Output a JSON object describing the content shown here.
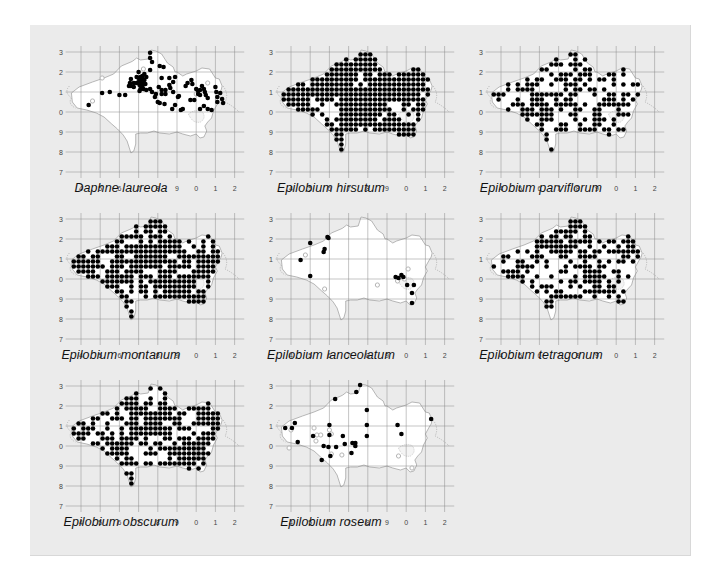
{
  "figure": {
    "background": "#ebebeb",
    "land_fill": "#ffffff",
    "record_color": "#000000",
    "old_record_color": "#b5b5b5",
    "grid_color": "#8a8a8a"
  },
  "axes": {
    "x_labels": [
      "4",
      "5",
      "6",
      "7",
      "8",
      "9",
      "0",
      "1",
      "2"
    ],
    "y_labels": [
      "3",
      "2",
      "1",
      "0",
      "9",
      "8",
      "7"
    ]
  },
  "chart_data": {
    "type": "scatter",
    "xlabel": "",
    "ylabel": "",
    "x_ticks": [
      "4",
      "5",
      "6",
      "7",
      "8",
      "9",
      "0",
      "1",
      "2"
    ],
    "y_ticks": [
      "3",
      "2",
      "1",
      "0",
      "9",
      "8",
      "7"
    ],
    "grid": true,
    "maps": [
      {
        "title": "Daphne laureola",
        "density": "sparse-moderate",
        "approx_records": 110
      },
      {
        "title": "Epilobium hirsutum",
        "density": "very dense",
        "approx_records": 650
      },
      {
        "title": "Epilobium parviflorum",
        "density": "moderate-dense",
        "approx_records": 380
      },
      {
        "title": "Epilobium montanum",
        "density": "dense",
        "approx_records": 560
      },
      {
        "title": "Epilobium lanceolatum",
        "density": "very sparse",
        "approx_records": 16
      },
      {
        "title": "Epilobium tetragonum",
        "density": "moderate-dense",
        "approx_records": 400
      },
      {
        "title": "Epilobium obscurum",
        "density": "dense",
        "approx_records": 520
      },
      {
        "title": "Epilobium roseum",
        "density": "sparse",
        "approx_records": 40
      }
    ]
  },
  "maps": [
    {
      "title": "Daphne laureola",
      "left": 16,
      "top": 27,
      "mode": "points",
      "points": [
        [
          3.6,
          0.04
        ],
        [
          3.6,
          0.3
        ],
        [
          3.7,
          0.5
        ],
        [
          3.6,
          0.9
        ],
        [
          3.0,
          1.0
        ],
        [
          3.3,
          1.1
        ],
        [
          3.2,
          1.2
        ],
        [
          3.4,
          1.25
        ],
        [
          4.1,
          0.7
        ],
        [
          4.3,
          0.75
        ],
        [
          4.6,
          1.3
        ],
        [
          4.8,
          1.5
        ],
        [
          4.2,
          1.3
        ],
        [
          4.9,
          1.25
        ],
        [
          2.9,
          1.25
        ],
        [
          3.0,
          1.3
        ],
        [
          3.1,
          1.25
        ],
        [
          3.1,
          1.4
        ],
        [
          3.2,
          1.35
        ],
        [
          3.3,
          1.4
        ],
        [
          2.6,
          1.35
        ],
        [
          2.6,
          1.7
        ],
        [
          2.75,
          1.55
        ],
        [
          2.9,
          1.55
        ],
        [
          3.0,
          1.5
        ],
        [
          3.1,
          1.55
        ],
        [
          3.25,
          1.55
        ],
        [
          3.35,
          1.6
        ],
        [
          3.05,
          1.65
        ],
        [
          3.2,
          1.7
        ],
        [
          2.5,
          1.7
        ],
        [
          2.75,
          1.75
        ],
        [
          3.05,
          1.95
        ],
        [
          3.1,
          1.85
        ],
        [
          3.25,
          1.85
        ],
        [
          3.4,
          1.9
        ],
        [
          3.6,
          1.85
        ],
        [
          3.7,
          2.0
        ],
        [
          3.9,
          2.1
        ],
        [
          3.85,
          2.25
        ],
        [
          4.05,
          1.75
        ],
        [
          4.2,
          1.9
        ],
        [
          4.2,
          2.1
        ],
        [
          4.4,
          2.1
        ],
        [
          4.6,
          1.65
        ],
        [
          4.65,
          1.8
        ],
        [
          4.4,
          1.9
        ],
        [
          4.1,
          2.55
        ],
        [
          4.35,
          2.6
        ],
        [
          4.0,
          2.5
        ],
        [
          4.8,
          2.0
        ],
        [
          5.05,
          2.25
        ],
        [
          4.9,
          2.65
        ],
        [
          4.75,
          2.85
        ],
        [
          5.2,
          2.9
        ],
        [
          5.3,
          2.85
        ],
        [
          5.7,
          2.4
        ],
        [
          5.75,
          1.4
        ],
        [
          5.55,
          1.55
        ],
        [
          5.8,
          1.6
        ],
        [
          5.45,
          1.7
        ],
        [
          6.3,
          1.7
        ],
        [
          6.2,
          1.9
        ],
        [
          6.4,
          1.85
        ],
        [
          6.45,
          2.0
        ],
        [
          6.5,
          2.15
        ],
        [
          6.2,
          2.15
        ],
        [
          6.1,
          1.95
        ],
        [
          6.6,
          2.3
        ],
        [
          7.0,
          1.75
        ],
        [
          7.05,
          2.0
        ],
        [
          7.25,
          2.05
        ],
        [
          7.1,
          2.25
        ],
        [
          7.35,
          2.35
        ],
        [
          7.4,
          2.55
        ],
        [
          1.1,
          2.05
        ],
        [
          1.5,
          2.0
        ],
        [
          2.0,
          2.15
        ],
        [
          2.3,
          2.15
        ],
        [
          2.55,
          1.55
        ],
        [
          0.4,
          2.65
        ],
        [
          5.1,
          2.2
        ],
        [
          6.1,
          2.1
        ],
        [
          5.9,
          2.4
        ],
        [
          6.0,
          1.85
        ],
        [
          6.4,
          2.7
        ],
        [
          6.6,
          2.85
        ],
        [
          6.8,
          2.9
        ],
        [
          6.2,
          2.85
        ],
        [
          7.1,
          2.5
        ]
      ],
      "old_points": [
        [
          0.6,
          2.45
        ],
        [
          3.25,
          1.6
        ],
        [
          6.0,
          2.1
        ],
        [
          6.6,
          1.55
        ],
        [
          3.25,
          0.85
        ],
        [
          1.1,
          1.3
        ]
      ]
    },
    {
      "title": "Epilobium hirsutum",
      "left": 226,
      "top": 27,
      "mode": "dense",
      "coverage": 0.92,
      "seed": 11
    },
    {
      "title": "Epilobium parviflorum",
      "left": 436,
      "top": 27,
      "mode": "dense",
      "coverage": 0.52,
      "seed": 23
    },
    {
      "title": "Epilobium montanum",
      "left": 16,
      "top": 194,
      "mode": "dense",
      "coverage": 0.75,
      "seed": 37
    },
    {
      "title": "Epilobium lanceolatum",
      "left": 226,
      "top": 194,
      "mode": "points",
      "points": [
        [
          1.9,
          0.9
        ],
        [
          1.0,
          1.2
        ],
        [
          1.7,
          1.65
        ],
        [
          1.95,
          0.95
        ],
        [
          0.5,
          2.05
        ],
        [
          1.0,
          2.85
        ],
        [
          5.45,
          2.9
        ],
        [
          5.6,
          2.95
        ],
        [
          5.85,
          2.9
        ],
        [
          5.75,
          2.8
        ],
        [
          6.05,
          3.3
        ],
        [
          6.4,
          3.3
        ],
        [
          6.3,
          3.7
        ],
        [
          6.3,
          4.2
        ],
        [
          1.75,
          1.5
        ]
      ],
      "old_points": [
        [
          0.75,
          1.8
        ],
        [
          1.75,
          3.5
        ],
        [
          4.5,
          3.3
        ],
        [
          6.1,
          2.5
        ],
        [
          5.55,
          3.1
        ],
        [
          5.9,
          3.0
        ]
      ]
    },
    {
      "title": "Epilobium tetragonum",
      "left": 436,
      "top": 194,
      "mode": "dense",
      "coverage": 0.5,
      "seed": 53
    },
    {
      "title": "Epilobium obscurum",
      "left": 16,
      "top": 361,
      "mode": "dense",
      "coverage": 0.68,
      "seed": 71
    },
    {
      "title": "Epilobium roseum",
      "left": 226,
      "top": 361,
      "mode": "points",
      "points": [
        [
          3.6,
          -0.05
        ],
        [
          2.3,
          0.65
        ],
        [
          3.4,
          0.3
        ],
        [
          3.95,
          1.2
        ],
        [
          3.95,
          1.95
        ],
        [
          2.0,
          1.95
        ],
        [
          2.0,
          2.45
        ],
        [
          2.7,
          2.5
        ],
        [
          3.95,
          2.5
        ],
        [
          1.15,
          2.5
        ],
        [
          1.95,
          3.05
        ],
        [
          2.35,
          3.05
        ],
        [
          1.7,
          3.0
        ],
        [
          2.8,
          2.9
        ],
        [
          3.2,
          2.85
        ],
        [
          3.35,
          2.85
        ],
        [
          3.35,
          3.0
        ],
        [
          3.15,
          3.35
        ],
        [
          2.05,
          3.5
        ],
        [
          1.6,
          3.7
        ],
        [
          0.2,
          1.85
        ],
        [
          -0.3,
          2.1
        ],
        [
          0.05,
          2.1
        ],
        [
          5.55,
          1.95
        ],
        [
          5.75,
          2.4
        ],
        [
          7.3,
          1.65
        ],
        [
          0.35,
          2.8
        ]
      ],
      "old_points": [
        [
          0.0,
          2.2
        ],
        [
          1.35,
          2.45
        ],
        [
          1.55,
          2.45
        ],
        [
          1.3,
          2.75
        ],
        [
          2.0,
          2.2
        ],
        [
          2.1,
          2.4
        ],
        [
          1.2,
          2.1
        ],
        [
          2.1,
          3.4
        ],
        [
          2.65,
          3.45
        ],
        [
          5.6,
          3.5
        ],
        [
          6.3,
          4.1
        ],
        [
          -0.1,
          3.1
        ]
      ]
    }
  ]
}
